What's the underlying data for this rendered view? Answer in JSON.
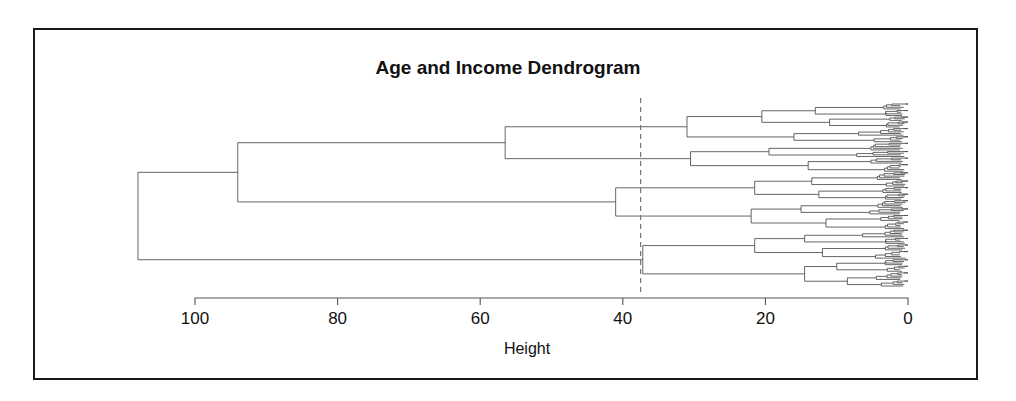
{
  "chart_data": {
    "type": "dendrogram",
    "title": "Age and Income Dendrogram",
    "xlabel": "Height",
    "ylabel": "",
    "orientation": "horizontal-reversed",
    "xlim": [
      100,
      0
    ],
    "ticks": [
      100,
      80,
      60,
      40,
      20,
      0
    ],
    "tick_labels": [
      "100",
      "80",
      "60",
      "40",
      "20",
      "0"
    ],
    "grid": false,
    "legend": false,
    "cut_line": {
      "height": 37.5,
      "style": "dashed",
      "color": "#777777"
    },
    "n_leaves": 120,
    "root_height": 108,
    "merge_heights": [
      108,
      94,
      56.5,
      41,
      37.2,
      31,
      30.5,
      21.5,
      20.5,
      19.5,
      16,
      13.5,
      13,
      11,
      9.5,
      8,
      7,
      6,
      5,
      4,
      3,
      2.5,
      2,
      1.5,
      1,
      0.7,
      0.4
    ],
    "tree": {
      "h": 108,
      "children": [
        {
          "h": 94,
          "children": [
            {
              "h": 56.5,
              "children": [
                {
                  "h": 31,
                  "children": [
                    {
                      "h": 20.5,
                      "children": [
                        {
                          "h": 13,
                          "children": [
                            {
                              "h": 8,
                              "n": 4
                            },
                            {
                              "h": 6.5,
                              "n": 4
                            }
                          ]
                        },
                        {
                          "h": 11,
                          "children": [
                            {
                              "h": 6,
                              "n": 3
                            },
                            {
                              "h": 5,
                              "n": 4
                            }
                          ]
                        }
                      ]
                    },
                    {
                      "h": 16,
                      "children": [
                        {
                          "h": 9,
                          "n": 5
                        },
                        {
                          "h": 7.5,
                          "n": 4
                        }
                      ]
                    }
                  ]
                },
                {
                  "h": 30.5,
                  "children": [
                    {
                      "h": 19.5,
                      "children": [
                        {
                          "h": 12,
                          "n": 5
                        },
                        {
                          "h": 10,
                          "n": 4
                        }
                      ]
                    },
                    {
                      "h": 14,
                      "children": [
                        {
                          "h": 8.5,
                          "n": 4
                        },
                        {
                          "h": 7,
                          "n": 5
                        }
                      ]
                    }
                  ]
                }
              ]
            },
            {
              "h": 41,
              "children": [
                {
                  "h": 21.5,
                  "children": [
                    {
                      "h": 13.5,
                      "children": [
                        {
                          "h": 9,
                          "n": 5
                        },
                        {
                          "h": 6.5,
                          "n": 4
                        }
                      ]
                    },
                    {
                      "h": 12.5,
                      "children": [
                        {
                          "h": 7,
                          "n": 4
                        },
                        {
                          "h": 5.5,
                          "n": 4
                        }
                      ]
                    }
                  ]
                },
                {
                  "h": 22,
                  "children": [
                    {
                      "h": 15,
                      "children": [
                        {
                          "h": 9.5,
                          "n": 5
                        },
                        {
                          "h": 8,
                          "n": 4
                        }
                      ]
                    },
                    {
                      "h": 11.5,
                      "children": [
                        {
                          "h": 7.5,
                          "n": 4
                        },
                        {
                          "h": 6,
                          "n": 5
                        }
                      ]
                    }
                  ]
                }
              ]
            }
          ]
        },
        {
          "h": 37.2,
          "children": [
            {
              "h": 21.5,
              "children": [
                {
                  "h": 14.5,
                  "children": [
                    {
                      "h": 9,
                      "n": 5
                    },
                    {
                      "h": 7,
                      "n": 4
                    }
                  ]
                },
                {
                  "h": 12,
                  "children": [
                    {
                      "h": 7.5,
                      "n": 4
                    },
                    {
                      "h": 5.5,
                      "n": 5
                    }
                  ]
                }
              ]
            },
            {
              "h": 14.5,
              "children": [
                {
                  "h": 10,
                  "children": [
                    {
                      "h": 6.5,
                      "n": 4
                    },
                    {
                      "h": 5,
                      "n": 4
                    }
                  ]
                },
                {
                  "h": 8.5,
                  "children": [
                    {
                      "h": 5.5,
                      "n": 5
                    },
                    {
                      "h": 4.5,
                      "n": 4
                    }
                  ]
                }
              ]
            }
          ]
        }
      ]
    }
  },
  "axis": {
    "title": "Age and Income Dendrogram",
    "xlabel": "Height",
    "tick_labels": [
      "100",
      "80",
      "60",
      "40",
      "20",
      "0"
    ]
  },
  "colors": {
    "frame": "#1a1a1a",
    "link": "#4a4a4a",
    "text": "#111111",
    "cut": "#777777",
    "background": "#ffffff"
  }
}
